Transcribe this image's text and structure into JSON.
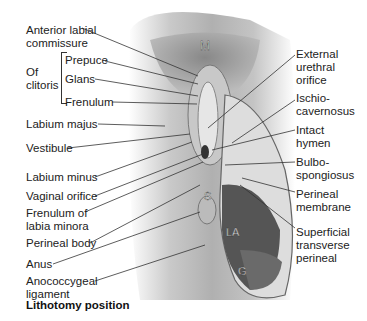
{
  "figure": {
    "caption": "Lithotomy position",
    "region_letters": {
      "mons": "M",
      "sphincter": "S",
      "levator_ani": "LA",
      "gluteus": "G"
    }
  },
  "labels_left": [
    {
      "id": "anterior-labial-commissure",
      "lines": [
        "Anterior labial",
        "commissure"
      ]
    },
    {
      "id": "of-clitoris",
      "lines": [
        "Of",
        "clitoris"
      ]
    },
    {
      "id": "prepuce",
      "lines": [
        "Prepuce"
      ]
    },
    {
      "id": "glans",
      "lines": [
        "Glans"
      ]
    },
    {
      "id": "frenulum",
      "lines": [
        "Frenulum"
      ]
    },
    {
      "id": "labium-majus",
      "lines": [
        "Labium majus"
      ]
    },
    {
      "id": "vestibule",
      "lines": [
        "Vestibule"
      ]
    },
    {
      "id": "labium-minus",
      "lines": [
        "Labium minus"
      ]
    },
    {
      "id": "vaginal-orifice",
      "lines": [
        "Vaginal orifice"
      ]
    },
    {
      "id": "frenulum-labia-minora",
      "lines": [
        "Frenulum of",
        "labia minora"
      ]
    },
    {
      "id": "perineal-body",
      "lines": [
        "Perineal body"
      ]
    },
    {
      "id": "anus",
      "lines": [
        "Anus"
      ]
    },
    {
      "id": "anococcygeal-ligament",
      "lines": [
        "Anococcygeal",
        "ligament"
      ]
    }
  ],
  "labels_right": [
    {
      "id": "external-urethral-orifice",
      "lines": [
        "External",
        "urethral",
        "orifice"
      ]
    },
    {
      "id": "ischiocavernosus",
      "lines": [
        "Ischio-",
        "cavernosus"
      ]
    },
    {
      "id": "intact-hymen",
      "lines": [
        "Intact",
        "hymen"
      ]
    },
    {
      "id": "bulbospongiosus",
      "lines": [
        "Bulbo-",
        "spongiosus"
      ]
    },
    {
      "id": "perineal-membrane",
      "lines": [
        "Perineal",
        "membrane"
      ]
    },
    {
      "id": "superficial-transverse-perineal",
      "lines": [
        "Superficial",
        "transverse",
        "perineal"
      ]
    }
  ]
}
